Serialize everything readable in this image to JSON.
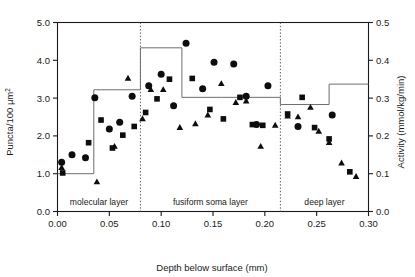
{
  "chart_data": {
    "type": "scatter",
    "title": "",
    "xlabel": "Depth below surface (mm)",
    "ylabel": "Puncta/100 μm²",
    "ylabel_right": "Activity (mmol/kg/min)",
    "xlim": [
      0.0,
      0.3
    ],
    "ylim": [
      0.0,
      5.0
    ],
    "ylim_right": [
      0.0,
      0.5
    ],
    "grid": false,
    "legend": null,
    "xticks": [
      "0.00",
      "0.05",
      "0.10",
      "0.15",
      "0.20",
      "0.25",
      "0.30"
    ],
    "xtick_values": [
      0.0,
      0.05,
      0.1,
      0.15,
      0.2,
      0.25,
      0.3
    ],
    "yticks": [
      "0.0",
      "1.0",
      "2.0",
      "3.0",
      "4.0",
      "5.0"
    ],
    "ytick_values": [
      0.0,
      1.0,
      2.0,
      3.0,
      4.0,
      5.0
    ],
    "yticks_right": [
      "0.0",
      "0.1",
      "0.2",
      "0.3",
      "0.4",
      "0.5"
    ],
    "ytick_values_right": [
      0.0,
      0.1,
      0.2,
      0.3,
      0.4,
      0.5
    ],
    "regions": [
      {
        "label": "molecular layer",
        "start": 0.0,
        "end": 0.08
      },
      {
        "label": "fusiform soma layer",
        "start": 0.08,
        "end": 0.215
      },
      {
        "label": "deep layer",
        "start": 0.215,
        "end": 0.3
      }
    ],
    "region_dividers": [
      0.08,
      0.215
    ],
    "step_series": {
      "name": "Activity",
      "axis": "right",
      "edges": [
        0.0,
        0.035,
        0.08,
        0.12,
        0.158,
        0.18,
        0.215,
        0.262,
        0.3
      ],
      "values": [
        0.1,
        0.322,
        0.433,
        0.302,
        0.302,
        0.302,
        0.283,
        0.337
      ]
    },
    "series": [
      {
        "name": "circles",
        "marker": "circle",
        "points": [
          [
            0.004,
            1.3
          ],
          [
            0.014,
            1.5
          ],
          [
            0.027,
            1.42
          ],
          [
            0.036,
            3.01
          ],
          [
            0.05,
            2.18
          ],
          [
            0.06,
            2.36
          ],
          [
            0.072,
            3.05
          ],
          [
            0.088,
            3.33
          ],
          [
            0.1,
            3.63
          ],
          [
            0.112,
            2.8
          ],
          [
            0.124,
            4.45
          ],
          [
            0.14,
            3.25
          ],
          [
            0.151,
            3.95
          ],
          [
            0.17,
            3.9
          ],
          [
            0.182,
            3.05
          ],
          [
            0.192,
            2.3
          ],
          [
            0.203,
            3.33
          ],
          [
            0.232,
            2.25
          ],
          [
            0.265,
            2.55
          ]
        ]
      },
      {
        "name": "squares",
        "marker": "square",
        "points": [
          [
            0.005,
            1.02
          ],
          [
            0.03,
            1.82
          ],
          [
            0.042,
            2.42
          ],
          [
            0.053,
            1.68
          ],
          [
            0.063,
            2.02
          ],
          [
            0.074,
            2.25
          ],
          [
            0.085,
            2.62
          ],
          [
            0.096,
            2.98
          ],
          [
            0.108,
            3.5
          ],
          [
            0.13,
            3.52
          ],
          [
            0.147,
            2.7
          ],
          [
            0.16,
            2.45
          ],
          [
            0.176,
            3.02
          ],
          [
            0.188,
            2.3
          ],
          [
            0.198,
            2.28
          ],
          [
            0.222,
            2.58
          ],
          [
            0.236,
            3.02
          ],
          [
            0.248,
            2.22
          ],
          [
            0.262,
            1.92
          ],
          [
            0.282,
            1.05
          ]
        ]
      },
      {
        "name": "triangles",
        "marker": "triangle",
        "points": [
          [
            0.004,
            1.16
          ],
          [
            0.038,
            0.78
          ],
          [
            0.055,
            1.72
          ],
          [
            0.068,
            3.52
          ],
          [
            0.082,
            2.45
          ],
          [
            0.09,
            3.22
          ],
          [
            0.102,
            3.22
          ],
          [
            0.118,
            2.22
          ],
          [
            0.133,
            2.32
          ],
          [
            0.145,
            2.55
          ],
          [
            0.158,
            3.38
          ],
          [
            0.172,
            2.88
          ],
          [
            0.182,
            2.92
          ],
          [
            0.196,
            1.72
          ],
          [
            0.21,
            2.28
          ],
          [
            0.222,
            2.52
          ],
          [
            0.232,
            2.5
          ],
          [
            0.244,
            2.75
          ],
          [
            0.252,
            2.12
          ],
          [
            0.262,
            1.82
          ],
          [
            0.274,
            1.28
          ],
          [
            0.288,
            0.92
          ]
        ]
      }
    ]
  }
}
